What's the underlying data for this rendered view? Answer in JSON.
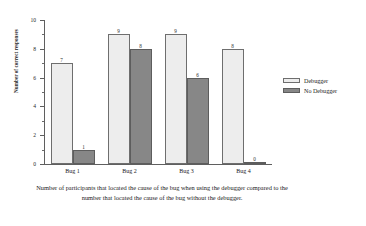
{
  "chart_data": {
    "type": "bar",
    "title": "",
    "subtitle": "",
    "xlabel": "",
    "ylabel": "Number of correct responses",
    "categories": [
      "Bug 1",
      "Bug 2",
      "Bug 3",
      "Bug 4"
    ],
    "series": [
      {
        "name": "Debugger",
        "values": [
          7,
          9,
          9,
          8
        ],
        "color": "#ededed"
      },
      {
        "name": "No Debugger",
        "values": [
          1,
          8,
          6,
          0
        ],
        "color": "#878787"
      }
    ],
    "ylim": [
      0,
      10
    ],
    "ytick_labels": [
      "0",
      "2",
      "4",
      "6",
      "8",
      "10"
    ],
    "ytick_values": [
      0,
      2,
      4,
      6,
      8,
      10
    ],
    "yminor_values": [
      1,
      3,
      5,
      7,
      9
    ],
    "grid": false,
    "legend_position": "right",
    "data_labels": true
  },
  "legend": {
    "items": [
      {
        "label": "Debugger",
        "swatch": "light-swatch"
      },
      {
        "label": "No Debugger",
        "swatch": "dark-swatch"
      }
    ]
  },
  "caption": {
    "text": "Number of participants that located the cause of the bug when using the debugger compared to the number that located the cause of the bug without the debugger."
  }
}
